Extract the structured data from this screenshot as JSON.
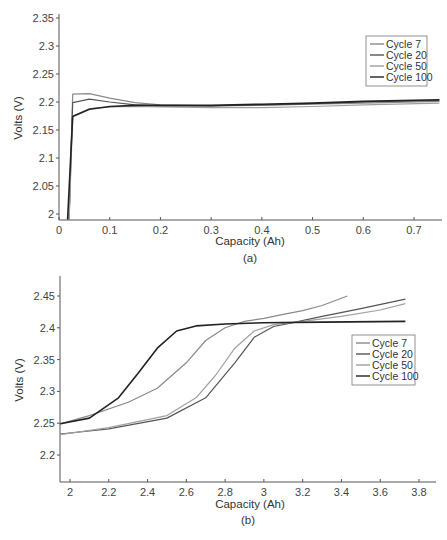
{
  "chart_data": [
    {
      "panel": "(a)",
      "type": "line",
      "title": "",
      "xlabel": "Capacity (Ah)",
      "ylabel": "Volts (V)",
      "xlim": [
        0,
        0.75
      ],
      "ylim": [
        1.99,
        2.355
      ],
      "xticks": [
        0,
        0.1,
        0.2,
        0.3,
        0.4,
        0.5,
        0.6,
        0.7
      ],
      "xtick_labels": [
        "0",
        "0.1",
        "0.2",
        "0.3",
        "0.4",
        "0.5",
        "0.6",
        "0.7"
      ],
      "yticks": [
        2,
        2.05,
        2.1,
        2.15,
        2.2,
        2.25,
        2.3,
        2.35
      ],
      "ytick_labels": [
        "2",
        "2.05",
        "2.1",
        "2.15",
        "2.2",
        "2.25",
        "2.3",
        "2.35"
      ],
      "grid": false,
      "legend_position": "upper right",
      "series": [
        {
          "name": "Cycle 7",
          "color": "#8a8a8a",
          "x": [
            0.02,
            0.027,
            0.06,
            0.1,
            0.15,
            0.2,
            0.3,
            0.4,
            0.5,
            0.6,
            0.75
          ],
          "y": [
            1.99,
            2.214,
            2.215,
            2.207,
            2.199,
            2.195,
            2.193,
            2.194,
            2.196,
            2.198,
            2.201
          ]
        },
        {
          "name": "Cycle 20",
          "color": "#555555",
          "x": [
            0.02,
            0.027,
            0.06,
            0.1,
            0.15,
            0.2,
            0.3,
            0.4,
            0.5,
            0.6,
            0.75
          ],
          "y": [
            1.99,
            2.199,
            2.205,
            2.2,
            2.195,
            2.193,
            2.193,
            2.195,
            2.197,
            2.2,
            2.203
          ]
        },
        {
          "name": "Cycle 50",
          "color": "#a0a0a0",
          "x": [
            0.02,
            0.027,
            0.06,
            0.1,
            0.15,
            0.2,
            0.3,
            0.4,
            0.5,
            0.6,
            0.75
          ],
          "y": [
            1.99,
            2.175,
            2.188,
            2.191,
            2.192,
            2.191,
            2.19,
            2.19,
            2.192,
            2.195,
            2.198
          ]
        },
        {
          "name": "Cycle 100",
          "color": "#222222",
          "x": [
            0.017,
            0.027,
            0.06,
            0.1,
            0.15,
            0.2,
            0.3,
            0.4,
            0.5,
            0.6,
            0.75
          ],
          "y": [
            1.99,
            2.174,
            2.187,
            2.192,
            2.194,
            2.194,
            2.194,
            2.196,
            2.198,
            2.201,
            2.204
          ]
        }
      ]
    },
    {
      "panel": "(b)",
      "type": "line",
      "title": "",
      "xlabel": "Capacity (Ah)",
      "ylabel": "Volts (V)",
      "xlim": [
        1.95,
        3.9
      ],
      "ylim": [
        2.157,
        2.482
      ],
      "xticks": [
        2,
        2.2,
        2.4,
        2.6,
        2.8,
        3,
        3.2,
        3.4,
        3.6,
        3.8
      ],
      "xtick_labels": [
        "2",
        "2.2",
        "2.4",
        "2.6",
        "2.8",
        "3",
        "3.2",
        "3.4",
        "3.6",
        "3.8"
      ],
      "yticks": [
        2.2,
        2.25,
        2.3,
        2.35,
        2.4,
        2.45
      ],
      "ytick_labels": [
        "2.2",
        "2.25",
        "2.3",
        "2.35",
        "2.4",
        "2.45"
      ],
      "grid": false,
      "legend_position": "center right",
      "series": [
        {
          "name": "Cycle 7",
          "color": "#8a8a8a",
          "x": [
            1.95,
            2.1,
            2.3,
            2.45,
            2.6,
            2.7,
            2.8,
            2.9,
            3.0,
            3.1,
            3.2,
            3.3,
            3.43
          ],
          "y": [
            2.249,
            2.262,
            2.283,
            2.305,
            2.345,
            2.38,
            2.4,
            2.41,
            2.415,
            2.421,
            2.427,
            2.435,
            2.45
          ]
        },
        {
          "name": "Cycle 20",
          "color": "#555555",
          "x": [
            1.95,
            2.2,
            2.5,
            2.7,
            2.85,
            2.95,
            3.05,
            3.15,
            3.3,
            3.5,
            3.73
          ],
          "y": [
            2.233,
            2.241,
            2.258,
            2.29,
            2.345,
            2.385,
            2.402,
            2.408,
            2.418,
            2.43,
            2.445
          ]
        },
        {
          "name": "Cycle 50",
          "color": "#a0a0a0",
          "x": [
            1.95,
            2.2,
            2.5,
            2.65,
            2.75,
            2.85,
            2.95,
            3.05,
            3.2,
            3.4,
            3.6,
            3.73
          ],
          "y": [
            2.232,
            2.243,
            2.262,
            2.29,
            2.325,
            2.368,
            2.395,
            2.405,
            2.41,
            2.418,
            2.428,
            2.438
          ]
        },
        {
          "name": "Cycle 100",
          "color": "#222222",
          "x": [
            1.95,
            2.1,
            2.25,
            2.35,
            2.45,
            2.55,
            2.65,
            2.8,
            3.0,
            3.3,
            3.73
          ],
          "y": [
            2.249,
            2.258,
            2.29,
            2.328,
            2.368,
            2.395,
            2.403,
            2.406,
            2.408,
            2.409,
            2.41
          ]
        }
      ]
    }
  ],
  "panels": {
    "a": {
      "caption": "(a)",
      "xlabel": "Capacity (Ah)",
      "ylabel": "Volts (V)",
      "legend": [
        "Cycle 7",
        "Cycle 20",
        "Cycle 50",
        "Cycle 100"
      ]
    },
    "b": {
      "caption": "(b)",
      "xlabel": "Capacity (Ah)",
      "ylabel": "Volts (V)",
      "legend": [
        "Cycle 7",
        "Cycle 20",
        "Cycle 50",
        "Cycle 100"
      ]
    }
  }
}
